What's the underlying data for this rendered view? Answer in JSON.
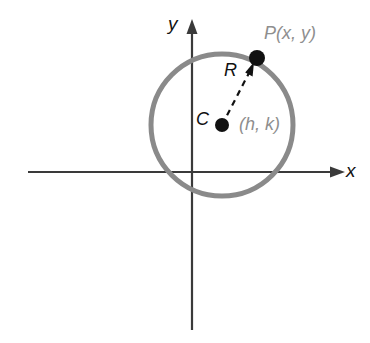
{
  "figure": {
    "kind": "circle-in-coordinate-plane",
    "background_color": "#ffffff"
  },
  "axes": {
    "x_axis": {
      "label": "x",
      "label_color": "#111111",
      "color": "#3a3a3a",
      "y_position": 172,
      "x_start": 28,
      "x_end": 345,
      "arrow": "right"
    },
    "y_axis": {
      "label": "y",
      "label_color": "#111111",
      "color": "#3a3a3a",
      "x_position": 192,
      "y_start": 20,
      "y_end": 330,
      "arrow": "up"
    }
  },
  "circle": {
    "name": "circle",
    "color": "#8a8a8a",
    "stroke_width": 5,
    "center_x": 222,
    "center_y": 125,
    "radius": 71
  },
  "points": [
    {
      "id": "center",
      "point_label": "C",
      "point_label_color": "#111111",
      "coordinate_label": "(h, k)",
      "coordinate_label_color": "#8e8e8e",
      "x": 222,
      "y": 125,
      "dot_radius": 7,
      "dot_color": "#111111"
    },
    {
      "id": "on-circle",
      "point_label": "P(x, y)",
      "point_label_color": "#8e8e8e",
      "coordinate_label": "",
      "x": 257,
      "y": 58,
      "dot_radius": 8,
      "dot_color": "#111111"
    }
  ],
  "radius_segment": {
    "label": "R",
    "label_color": "#111111",
    "style": "dashed",
    "color": "#111111",
    "stroke_width": 2,
    "dash_pattern": "6 5",
    "from_x": 222,
    "from_y": 125,
    "to_x": 257,
    "to_y": 58,
    "arrow": "toward-P"
  }
}
